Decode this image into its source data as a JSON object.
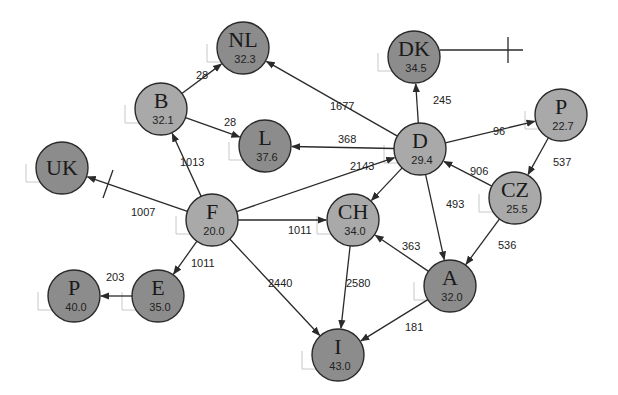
{
  "colors": {
    "light_node": "#a9a9a9",
    "dark_node": "#8c8c8c",
    "node_stroke": "#2a2a2a",
    "edge": "#2a2a2a",
    "background": "#ffffff"
  },
  "nodes": [
    {
      "id": "NL",
      "label": "NL",
      "value": "32.3",
      "x": 243,
      "y": 48,
      "shade": "dark"
    },
    {
      "id": "B",
      "label": "B",
      "value": "32.1",
      "x": 161,
      "y": 109,
      "shade": "light"
    },
    {
      "id": "L",
      "label": "L",
      "value": "37.6",
      "x": 265,
      "y": 146,
      "shade": "dark"
    },
    {
      "id": "UK",
      "label": "UK",
      "value": "",
      "x": 62,
      "y": 168,
      "shade": "dark"
    },
    {
      "id": "DK",
      "label": "DK",
      "value": "34.5",
      "x": 414,
      "y": 57,
      "shade": "dark"
    },
    {
      "id": "D",
      "label": "D",
      "value": "29.4",
      "x": 420,
      "y": 149,
      "shade": "light"
    },
    {
      "id": "P_east",
      "label": "P",
      "value": "22.7",
      "x": 561,
      "y": 115,
      "shade": "light"
    },
    {
      "id": "F",
      "label": "F",
      "value": "20.0",
      "x": 212,
      "y": 220,
      "shade": "light"
    },
    {
      "id": "CH",
      "label": "CH",
      "value": "34.0",
      "x": 353,
      "y": 220,
      "shade": "light"
    },
    {
      "id": "CZ",
      "label": "CZ",
      "value": "25.5",
      "x": 515,
      "y": 198,
      "shade": "light"
    },
    {
      "id": "P_west",
      "label": "P",
      "value": "40.0",
      "x": 74,
      "y": 296,
      "shade": "dark"
    },
    {
      "id": "E",
      "label": "E",
      "value": "35.0",
      "x": 158,
      "y": 296,
      "shade": "dark"
    },
    {
      "id": "A",
      "label": "A",
      "value": "32.0",
      "x": 450,
      "y": 286,
      "shade": "dark"
    },
    {
      "id": "I",
      "label": "I",
      "value": "43.0",
      "x": 338,
      "y": 355,
      "shade": "dark"
    }
  ],
  "edges": [
    {
      "from": "B",
      "to": "NL",
      "label": "28",
      "lx": 196,
      "ly": 79
    },
    {
      "from": "B",
      "to": "L",
      "label": "28",
      "lx": 224,
      "ly": 126
    },
    {
      "from": "F",
      "to": "B",
      "label": "1013",
      "lx": 180,
      "ly": 166
    },
    {
      "from": "F",
      "to": "UK",
      "label": "1007",
      "lx": 131,
      "ly": 216
    },
    {
      "from": "D",
      "to": "NL",
      "label": "1677",
      "lx": 330,
      "ly": 110
    },
    {
      "from": "D",
      "to": "L",
      "label": "368",
      "lx": 338,
      "ly": 143
    },
    {
      "from": "D",
      "to": "DK",
      "label": "245",
      "lx": 433,
      "ly": 104
    },
    {
      "from": "D",
      "to": "P_east",
      "label": "96",
      "lx": 493,
      "ly": 135
    },
    {
      "from": "F",
      "to": "D",
      "label": "2143",
      "lx": 350,
      "ly": 170
    },
    {
      "from": "P_east",
      "to": "CZ",
      "label": "537",
      "lx": 553,
      "ly": 166
    },
    {
      "from": "CZ",
      "to": "D",
      "label": "906",
      "lx": 470,
      "ly": 175
    },
    {
      "from": "F",
      "to": "CH",
      "label": "1011",
      "lx": 288,
      "ly": 234
    },
    {
      "from": "D",
      "to": "CH",
      "label": "",
      "lx": 0,
      "ly": 0
    },
    {
      "from": "D",
      "to": "A",
      "label": "493",
      "lx": 446,
      "ly": 208
    },
    {
      "from": "F",
      "to": "E",
      "label": "1011",
      "lx": 191,
      "ly": 267
    },
    {
      "from": "E",
      "to": "P_west",
      "label": "203",
      "lx": 106,
      "ly": 281
    },
    {
      "from": "F",
      "to": "I",
      "label": "2440",
      "lx": 268,
      "ly": 287
    },
    {
      "from": "CH",
      "to": "I",
      "label": "2580",
      "lx": 346,
      "ly": 287
    },
    {
      "from": "A",
      "to": "CH",
      "label": "363",
      "lx": 402,
      "ly": 250
    },
    {
      "from": "CZ",
      "to": "A",
      "label": "536",
      "lx": 498,
      "ly": 249
    },
    {
      "from": "A",
      "to": "I",
      "label": "181",
      "lx": 405,
      "ly": 331
    }
  ],
  "external_links": [
    {
      "from": "DK",
      "label": "",
      "to_x": 523,
      "to_y": 50
    }
  ],
  "diagram": {
    "node_radius": 26
  }
}
